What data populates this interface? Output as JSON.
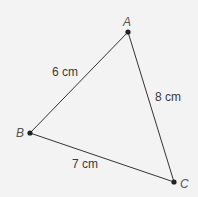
{
  "diagram": {
    "type": "triangle",
    "vertices": [
      {
        "name": "A",
        "x": 128,
        "y": 32
      },
      {
        "name": "B",
        "x": 30,
        "y": 133
      },
      {
        "name": "C",
        "x": 174,
        "y": 182
      }
    ],
    "sides": [
      {
        "from": "A",
        "to": "B",
        "label": "6 cm"
      },
      {
        "from": "A",
        "to": "C",
        "label": "8 cm"
      },
      {
        "from": "B",
        "to": "C",
        "label": "7 cm"
      }
    ],
    "colors": {
      "line": "#333333",
      "background": "#f3f3f3"
    }
  }
}
